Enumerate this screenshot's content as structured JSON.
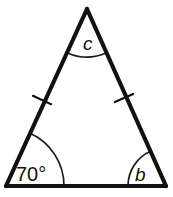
{
  "figure": {
    "kind": "isosceles-triangle",
    "background_color": "#ffffff",
    "stroke_color": "#111111",
    "canvas": {
      "width": 173,
      "height": 197
    },
    "vertices": {
      "apex": {
        "name": "apex",
        "x": 87,
        "y": 9
      },
      "bottom_left": {
        "name": "bottom-left",
        "x": 6,
        "y": 186
      },
      "bottom_right": {
        "name": "bottom-right",
        "x": 166,
        "y": 186
      }
    },
    "angles": [
      {
        "id": "apex",
        "label": "c",
        "style": "italic",
        "label_x": 83,
        "label_y": 50,
        "arc_radius": 48,
        "is_known": false
      },
      {
        "id": "bottom-left",
        "label": "70°",
        "style": "upright",
        "label_x": 16,
        "label_y": 181,
        "arc_radius": 58,
        "is_known": true,
        "value_degrees": 70
      },
      {
        "id": "bottom-right",
        "label": "b",
        "style": "italic",
        "label_x": 135,
        "label_y": 181,
        "arc_radius": 38,
        "is_known": false
      }
    ],
    "tick_marks": [
      {
        "id": "left-leg-tick",
        "x": 42,
        "y": 100,
        "count": 1
      },
      {
        "id": "right-leg-tick",
        "x": 124,
        "y": 98,
        "count": 1
      }
    ]
  }
}
